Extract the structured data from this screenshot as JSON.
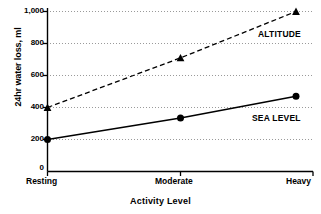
{
  "chart_data": {
    "type": "line",
    "title": "",
    "xlabel": "Activity Level",
    "ylabel": "24hr water loss, ml",
    "categories": [
      "Resting",
      "Moderate",
      "Heavy"
    ],
    "ylim": [
      0,
      1000
    ],
    "yticks": [
      0,
      200,
      400,
      600,
      800,
      1000
    ],
    "ytick_labels": [
      "0",
      "200",
      "400",
      "600",
      "800",
      "1,000"
    ],
    "grid": "horizontal-dotted",
    "legend_position": "inline-right",
    "series": [
      {
        "name": "ALTITUDE",
        "values": [
          400,
          710,
          1000
        ],
        "marker": "triangle",
        "linestyle": "dashed",
        "color": "#000000"
      },
      {
        "name": "SEA LEVEL",
        "values": [
          200,
          335,
          470
        ],
        "marker": "circle",
        "linestyle": "solid",
        "color": "#000000"
      }
    ]
  },
  "axis": {
    "y_label": "24hr water loss, ml",
    "x_label": "Activity Level",
    "y_tick_0": "0",
    "y_tick_200": "200",
    "y_tick_400": "400",
    "y_tick_600": "600",
    "y_tick_800": "800",
    "y_tick_1000": "1,000",
    "x_tick_1": "Resting",
    "x_tick_2": "Moderate",
    "x_tick_3": "Heavy"
  },
  "labels": {
    "altitude": "ALTITUDE",
    "sea_level": "SEA LEVEL"
  },
  "colors": {
    "ink": "#000000",
    "grid": "#b8b8b8",
    "background": "#ffffff"
  }
}
